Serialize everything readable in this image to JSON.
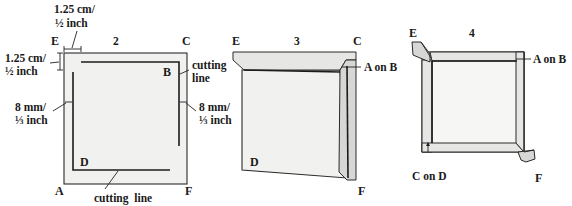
{
  "figure": {
    "panels": [
      {
        "id": "2",
        "step_label": "2",
        "corner_labels": {
          "top_left": "E",
          "top_right": "C",
          "bottom_left": "A",
          "bottom_right": "F",
          "inner_top_right": "B",
          "inner_bottom_left": "D"
        },
        "annotations": {
          "top_margin_1": "1.25 cm/",
          "top_margin_2": "½ inch",
          "left_margin_1": "1.25 cm/",
          "left_margin_2": "½ inch",
          "left_gap_1": "8 mm/",
          "left_gap_2": "⅓ inch",
          "right_gap_1": "8 mm/",
          "right_gap_2": "⅓ inch",
          "right_cut_1": "cutting",
          "right_cut_2": "line",
          "bottom_cut": "cutting  line"
        }
      },
      {
        "id": "3",
        "step_label": "3",
        "corner_labels": {
          "top_left": "E",
          "top_right": "C",
          "inner_bottom_left": "D",
          "bottom_right": "F"
        },
        "annotations": {
          "fold_note": "A on B"
        }
      },
      {
        "id": "4",
        "step_label": "4",
        "corner_labels": {
          "top_left": "E",
          "bottom_right": "F"
        },
        "annotations": {
          "fold_note_top": "A on B",
          "fold_note_bottom": "C on D"
        }
      }
    ]
  }
}
